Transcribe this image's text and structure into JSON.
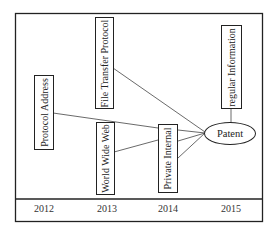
{
  "diagram": {
    "nodes": [
      {
        "id": "protocol-address",
        "label": "Protocol Address",
        "year": "2012"
      },
      {
        "id": "file-transfer-protocol",
        "label": "File Transfer Protocol",
        "year": "2013"
      },
      {
        "id": "world-wide-web",
        "label": "World Wide Web",
        "year": "2013"
      },
      {
        "id": "private-internal",
        "label": "Private Internal",
        "year": "2014"
      },
      {
        "id": "regular-information",
        "label": "regular Information",
        "year": "2015"
      },
      {
        "id": "patent",
        "label": "Patent",
        "year": "2015",
        "shape": "ellipse"
      }
    ],
    "edges": [
      {
        "from": "protocol-address",
        "to": "private-internal"
      },
      {
        "from": "world-wide-web",
        "to": "private-internal"
      },
      {
        "from": "file-transfer-protocol",
        "to": "patent"
      },
      {
        "from": "private-internal",
        "to": "patent",
        "count": 3
      },
      {
        "from": "regular-information",
        "to": "patent"
      }
    ]
  },
  "timeline": {
    "years": [
      "2012",
      "2013",
      "2014",
      "2015"
    ]
  },
  "colors": {
    "stroke": "#222222",
    "background": "#ffffff"
  }
}
